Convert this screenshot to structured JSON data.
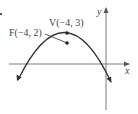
{
  "figure": {
    "type": "parabola-diagram",
    "axes": {
      "x_label": "x",
      "y_label": "y"
    },
    "points": {
      "vertex": {
        "name": "V",
        "coords": "(−4, 3)",
        "x": -4,
        "y": 3
      },
      "focus": {
        "name": "F",
        "coords": "(−4, 2)",
        "x": -4,
        "y": 2
      }
    },
    "labels": {
      "vertex_label": "V(−4, 3)",
      "focus_label": "F(−4, 2)"
    },
    "curve": {
      "description": "Downward-opening parabola with vertex V(−4, 3) and focus F(−4, 2)",
      "opens": "down"
    },
    "colors": {
      "stroke": "#3a3a3a",
      "axis": "#6a6a6a",
      "text": "#444444",
      "background": "#ffffff"
    }
  }
}
